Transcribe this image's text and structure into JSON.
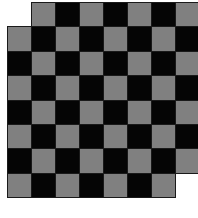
{
  "diagram": {
    "title": "",
    "type": "mutilated-checkerboard",
    "rows": 8,
    "cols": 8,
    "square_width": 24,
    "square_height": 24.4,
    "colors": {
      "light": "#808080",
      "dark": "#050505",
      "border": "#1a1a1a",
      "background": "#ffffff"
    },
    "light_when": "(row+col) odd",
    "removed_squares": [
      {
        "row": 0,
        "col": 0
      },
      {
        "row": 7,
        "col": 7
      }
    ]
  }
}
